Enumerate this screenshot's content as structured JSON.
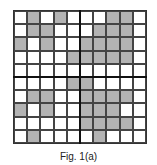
{
  "figure": {
    "caption": "Fig. 1(a)",
    "rows": 10,
    "cols": 10,
    "shade_color": "#b3b3b3",
    "shaded_cells": [
      [
        0,
        1
      ],
      [
        0,
        3
      ],
      [
        0,
        7
      ],
      [
        0,
        8
      ],
      [
        1,
        1
      ],
      [
        1,
        2
      ],
      [
        1,
        6
      ],
      [
        1,
        7
      ],
      [
        1,
        8
      ],
      [
        2,
        0
      ],
      [
        2,
        2
      ],
      [
        2,
        5
      ],
      [
        2,
        6
      ],
      [
        2,
        7
      ],
      [
        2,
        8
      ],
      [
        3,
        4
      ],
      [
        3,
        5
      ],
      [
        3,
        6
      ],
      [
        3,
        7
      ],
      [
        3,
        8
      ],
      [
        5,
        4
      ],
      [
        5,
        5
      ],
      [
        6,
        1
      ],
      [
        6,
        2
      ],
      [
        6,
        5
      ],
      [
        6,
        6
      ],
      [
        6,
        7
      ],
      [
        6,
        8
      ],
      [
        7,
        0
      ],
      [
        7,
        2
      ],
      [
        7,
        5
      ],
      [
        7,
        6
      ],
      [
        7,
        7
      ],
      [
        8,
        5
      ],
      [
        8,
        6
      ],
      [
        8,
        7
      ],
      [
        8,
        8
      ],
      [
        9,
        1
      ],
      [
        9,
        6
      ]
    ]
  }
}
